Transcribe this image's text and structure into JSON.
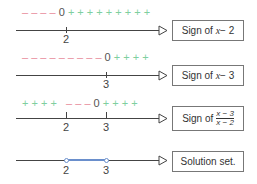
{
  "rows": [
    {
      "signs": {
        "neg": "– – – –",
        "zero": "0",
        "pos": "+ + + + + + + + +"
      },
      "ticks": [
        "2"
      ],
      "label": {
        "prefix": "Sign of ",
        "var": "x",
        "rest": " − 2"
      }
    },
    {
      "signs": {
        "neg": "– – – – – – – – –",
        "zero": "0",
        "pos": "+ + + +"
      },
      "ticks": [
        "3"
      ],
      "label": {
        "prefix": "Sign of ",
        "var": "x",
        "rest": " − 3"
      }
    },
    {
      "signs": {
        "pos_left": "+ + + +",
        "neg": "– – –",
        "zero": "0",
        "pos": "+ + + +"
      },
      "ticks": [
        "2",
        "3"
      ],
      "label": {
        "prefix": "Sign of",
        "numerator": "x − 3",
        "denominator": "x − 2"
      }
    },
    {
      "ticks": [
        "2",
        "3"
      ],
      "label": {
        "text": "Solution set."
      }
    }
  ],
  "colors": {
    "negative": "#e8899a",
    "positive": "#7fcf9f",
    "solution": "#6a8fcc",
    "axis": "#444444"
  }
}
